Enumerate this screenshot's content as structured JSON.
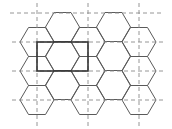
{
  "diagram": {
    "colors": {
      "hex_stroke": "#5a5a5a",
      "grid_dash": "#8a8a8a",
      "selection_rect": "#333333",
      "background": "#ffffff"
    },
    "hex": {
      "orientation": "flat-top",
      "side": 17,
      "half_height": 14.5,
      "columns": [
        {
          "cx": 37,
          "rows_cy": [
            42,
            71,
            100
          ]
        },
        {
          "cx": 62.5,
          "rows_cy": [
            27,
            56,
            85
          ]
        },
        {
          "cx": 88,
          "rows_cy": [
            42,
            71,
            100
          ]
        },
        {
          "cx": 113.5,
          "rows_cy": [
            27,
            56,
            85
          ]
        },
        {
          "cx": 139,
          "rows_cy": [
            42,
            71,
            100
          ]
        }
      ]
    },
    "dashed_grid": {
      "horizontal": [
        {
          "y": 13,
          "x1": 10,
          "x2": 164
        },
        {
          "y": 42,
          "x1": 12,
          "x2": 165
        },
        {
          "y": 71,
          "x1": 12,
          "x2": 165
        },
        {
          "y": 100,
          "x1": 12,
          "x2": 165
        }
      ],
      "vertical": [
        {
          "x": 37,
          "y1": 3,
          "y2": 128
        },
        {
          "x": 88,
          "y1": 3,
          "y2": 128
        },
        {
          "x": 139,
          "y1": 3,
          "y2": 128
        }
      ]
    },
    "selection_rect": {
      "x": 37,
      "y": 42,
      "width": 51,
      "height": 29
    }
  }
}
